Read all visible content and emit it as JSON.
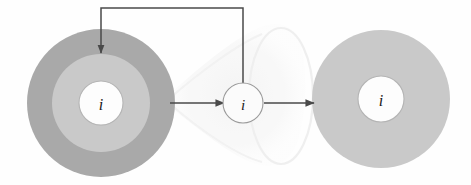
{
  "figure": {
    "kind": "diagram",
    "caption": "",
    "background_color": "#fefefe",
    "width": 471,
    "height": 185
  },
  "palette": {
    "outer_ring_fill": "#a9a9a9",
    "middle_ring_fill": "#c9c9c9",
    "right_disc_fill": "#c9c9c9",
    "inner_core_fill": "#fdfdfd",
    "core_stroke": "#b4b4b4",
    "small_node_fill": "#fbfbfb",
    "small_node_stroke": "#9a9a9a",
    "arrow_color": "#4a4a4a",
    "ghost_cone_fill": "#f4f4f4",
    "ghost_cone_stroke": "#ececec"
  },
  "nodes": [
    {
      "id": "left-node",
      "name": "left-layered-node",
      "label": "i",
      "cx": 101,
      "cy": 103,
      "rings": [
        {
          "name": "outer-ring",
          "r": 74,
          "fill": "#a9a9a9"
        },
        {
          "name": "middle-ring",
          "r": 49,
          "fill": "#c9c9c9"
        },
        {
          "name": "inner-core",
          "r": 22,
          "fill": "#fdfdfd",
          "stroke": "#b4b4b4"
        }
      ]
    },
    {
      "id": "middle-node",
      "name": "middle-small-node",
      "label": "i",
      "cx": 243,
      "cy": 103,
      "rings": [
        {
          "name": "node-disc",
          "r": 20,
          "fill": "#fbfbfb",
          "stroke": "#9a9a9a"
        }
      ]
    },
    {
      "id": "right-node",
      "name": "right-filled-node",
      "label": "i",
      "cx": 381,
      "cy": 99,
      "rings": [
        {
          "name": "outer-disc",
          "r": 69,
          "fill": "#c9c9c9"
        },
        {
          "name": "inner-core",
          "r": 23,
          "fill": "#fdfdfd",
          "stroke": "#b4b4b4"
        }
      ]
    }
  ],
  "edges": [
    {
      "id": "edge-left-to-middle",
      "name": "arrow-left-to-middle",
      "from": "left-node",
      "to": "middle-node",
      "kind": "straight-arrow",
      "x1": 170,
      "y1": 103,
      "x2": 222,
      "y2": 103
    },
    {
      "id": "edge-middle-to-right",
      "name": "arrow-middle-to-right",
      "from": "middle-node",
      "to": "right-node",
      "kind": "straight-arrow",
      "x1": 264,
      "y1": 103,
      "x2": 312,
      "y2": 103
    },
    {
      "id": "edge-feedback",
      "name": "arrow-feedback-middle-to-left",
      "from": "middle-node",
      "to": "left-node",
      "kind": "orthogonal-feedback-arrow",
      "path": "M 243 83 L 243 8 L 101 8 L 101 54",
      "arrow_at": {
        "x": 101,
        "y": 56
      }
    }
  ],
  "ghost_shape": {
    "name": "background-cone-artifact",
    "description": "faint light cone widening left-to-right with faint ellipse at right",
    "visible": true
  }
}
